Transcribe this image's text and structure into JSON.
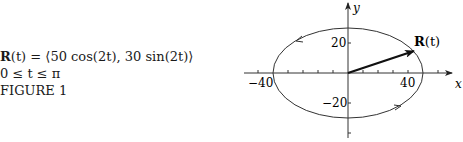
{
  "caption": {
    "equation_prefix": "R",
    "equation_rest": "(t) = ⟨50 cos(2t), 30 sin(2t)⟩",
    "domain": "0 ≤ t ≤ π",
    "figure_label": "FIGURE 1"
  },
  "plot": {
    "x_axis_label": "x",
    "y_axis_label": "y",
    "x_tick_labels": [
      "−40",
      "40"
    ],
    "y_tick_labels": [
      "20",
      "−20"
    ],
    "vector_label_bold": "R",
    "vector_label_rest": "(t)",
    "ellipse": {
      "semi_major_x": 50,
      "semi_minor_y": 30
    },
    "orientation": "counterclockwise"
  }
}
